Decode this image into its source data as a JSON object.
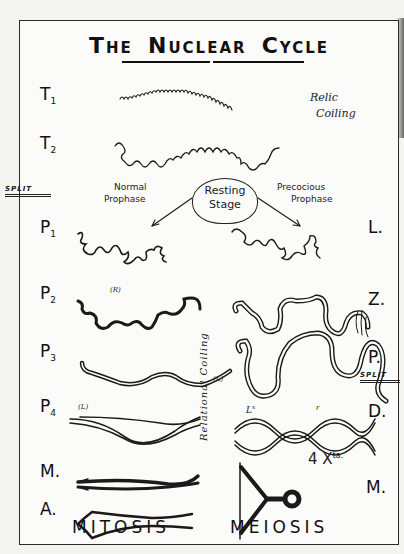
{
  "title": {
    "words": [
      "THE",
      "NUCLEAR",
      "CYCLE"
    ],
    "first_letters": [
      "T",
      "N",
      "C"
    ],
    "rest": [
      "HE",
      "UCLEAR",
      "YCLE"
    ]
  },
  "stages_left": [
    {
      "id": "T1",
      "letter": "T",
      "sub": "1"
    },
    {
      "id": "T2",
      "letter": "T",
      "sub": "2"
    },
    {
      "id": "P1",
      "letter": "P",
      "sub": "1"
    },
    {
      "id": "P2",
      "letter": "P",
      "sub": "2"
    },
    {
      "id": "P3",
      "letter": "P",
      "sub": "3"
    },
    {
      "id": "P4",
      "letter": "P",
      "sub": "4"
    },
    {
      "id": "M",
      "letter": "M."
    },
    {
      "id": "A",
      "letter": "A."
    }
  ],
  "stages_right": [
    {
      "id": "L",
      "letter": "L."
    },
    {
      "id": "Z",
      "letter": "Z."
    },
    {
      "id": "P",
      "letter": "P."
    },
    {
      "id": "D",
      "letter": "D."
    },
    {
      "id": "M",
      "letter": "M."
    }
  ],
  "annotations": {
    "relic_coiling": [
      "Relic",
      "Coiling"
    ],
    "resting_stage": [
      "Resting",
      "Stage"
    ],
    "normal_prophase": [
      "Normal",
      "Prophase"
    ],
    "precocious_prophase": [
      "Precocious",
      "Prophase"
    ],
    "split_left": "SPLIT",
    "split_right": "SPLIT",
    "relational_coiling": "Relational Coiling",
    "p2_mark": "(R)",
    "p4_mark": "(L)",
    "meiosis_mark": "(L)",
    "chiasma_label": "L",
    "chiasma_sup": "x",
    "chiasma_mark_r": "r",
    "chiasmata_count": "4 X",
    "chiasmata_sup": "ta."
  },
  "footer": {
    "left": "MITOSIS",
    "right": "MEIOSIS"
  },
  "colors": {
    "ink": "#1a1a1a",
    "paper": "#fbfbf9",
    "background": "#f4f4f2"
  }
}
